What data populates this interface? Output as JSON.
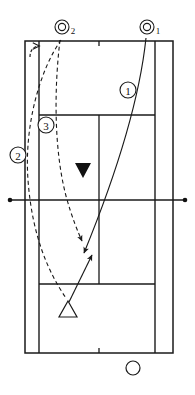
{
  "diagram": {
    "court_color": "#ffffff",
    "line_color": "#1a1a1a",
    "marker_color": "#111111"
  },
  "court": {
    "outer_left": 25,
    "outer_right": 173,
    "baseline_top": 41,
    "baseline_bottom": 353,
    "singles_left": 39,
    "singles_right": 155,
    "service_line_top": 115,
    "service_line_bottom": 284,
    "net_y": 200,
    "center_x": 99,
    "net_post_left_x": 10,
    "net_post_right_x": 185
  },
  "shots": [
    {
      "id": "shot-1",
      "label": "1",
      "sublabel": "",
      "badge_x": 128,
      "badge_y": 90,
      "description": "Deep crosscourt drive from the receiver's side toward the opponent baseline"
    },
    {
      "id": "shot-2",
      "label": "2",
      "sublabel": "",
      "badge_x": 18,
      "badge_y": 155,
      "description": "Wide outside recovery run along the doubles alley"
    },
    {
      "id": "shot-3",
      "label": "3",
      "sublabel": "",
      "badge_x": 46,
      "badge_y": 125,
      "description": "Short angled reply landing near the service box corner"
    }
  ],
  "ball_markers": [
    {
      "id": "ball-2",
      "label": "2",
      "center_x": 62,
      "center_y": 27,
      "description": "Ball contact point two, top left of the court"
    },
    {
      "id": "ball-1",
      "label": "1",
      "center_x": 147,
      "center_y": 27,
      "description": "Ball contact point one, top right of the court"
    }
  ],
  "players": [
    {
      "id": "player-filled-triangle",
      "symbol": "filled-down-triangle",
      "center_x": 83,
      "center_y": 170,
      "description": "Opponent at the far side near the net"
    },
    {
      "id": "player-open-triangle",
      "symbol": "open-up-triangle",
      "center_x": 68,
      "center_y": 310,
      "description": "Player approaching from the near side court"
    },
    {
      "id": "player-circle",
      "symbol": "open-circle",
      "center_x": 133,
      "center_y": 368,
      "description": "Server waiting behind the near baseline"
    }
  ],
  "legend": {
    "solid_line": "Ball trajectory",
    "dashed_line": "Player movement",
    "filled_triangle": "Opponent position",
    "open_triangle": "Player position",
    "open_circle": "Serving player"
  }
}
